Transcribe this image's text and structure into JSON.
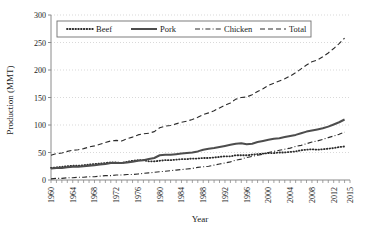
{
  "chart_data": {
    "type": "line",
    "title": "",
    "xlabel": "Year",
    "ylabel": "Production (MMT)",
    "xlim": [
      1960,
      2015
    ],
    "ylim": [
      0,
      300
    ],
    "yticks": [
      0,
      50,
      100,
      150,
      200,
      250,
      300
    ],
    "xticks": [
      1960,
      1964,
      1968,
      1972,
      1976,
      1980,
      1984,
      1988,
      1992,
      1996,
      2000,
      2004,
      2008,
      2012,
      2015
    ],
    "grid": true,
    "legend_position": "top-left",
    "x": [
      1960,
      1961,
      1962,
      1963,
      1964,
      1965,
      1966,
      1967,
      1968,
      1969,
      1970,
      1971,
      1972,
      1973,
      1974,
      1975,
      1976,
      1977,
      1978,
      1979,
      1980,
      1981,
      1982,
      1983,
      1984,
      1985,
      1986,
      1987,
      1988,
      1989,
      1990,
      1991,
      1992,
      1993,
      1994,
      1995,
      1996,
      1997,
      1998,
      1999,
      2000,
      2001,
      2002,
      2003,
      2004,
      2005,
      2006,
      2007,
      2008,
      2009,
      2010,
      2011,
      2012,
      2013,
      2014
    ],
    "series": [
      {
        "name": "Beef",
        "style": "dotted",
        "color": "#2b2b2b",
        "values": [
          22,
          23,
          24,
          25,
          26,
          26,
          27,
          28,
          29,
          30,
          31,
          32,
          32,
          31,
          33,
          35,
          36,
          36,
          34,
          34,
          35,
          36,
          36,
          37,
          38,
          38,
          39,
          39,
          40,
          40,
          41,
          42,
          43,
          43,
          45,
          45,
          45,
          46,
          47,
          48,
          49,
          49,
          50,
          50,
          51,
          52,
          54,
          55,
          56,
          55,
          56,
          57,
          58,
          60,
          61
        ]
      },
      {
        "name": "Pork",
        "style": "solid",
        "color": "#4d4d4d",
        "values": [
          21,
          22,
          22,
          23,
          24,
          24,
          25,
          26,
          27,
          28,
          29,
          31,
          31,
          31,
          32,
          33,
          35,
          36,
          38,
          40,
          45,
          46,
          46,
          47,
          48,
          49,
          50,
          52,
          55,
          57,
          58,
          60,
          62,
          64,
          66,
          67,
          65,
          66,
          69,
          71,
          73,
          75,
          76,
          78,
          80,
          82,
          85,
          88,
          90,
          92,
          94,
          97,
          101,
          105,
          110
        ]
      },
      {
        "name": "Chicken",
        "style": "dashdot",
        "color": "#2b2b2b",
        "values": [
          2,
          3,
          3,
          4,
          4,
          5,
          5,
          6,
          6,
          7,
          8,
          8,
          9,
          9,
          10,
          10,
          11,
          12,
          13,
          14,
          15,
          16,
          17,
          18,
          19,
          20,
          21,
          23,
          24,
          25,
          27,
          29,
          31,
          33,
          36,
          38,
          41,
          43,
          45,
          47,
          50,
          52,
          54,
          56,
          58,
          61,
          63,
          66,
          69,
          71,
          74,
          77,
          80,
          83,
          87
        ]
      },
      {
        "name": "Total",
        "style": "dashed",
        "color": "#2b2b2b",
        "values": [
          45,
          48,
          49,
          52,
          54,
          55,
          57,
          60,
          62,
          65,
          68,
          71,
          72,
          71,
          75,
          78,
          82,
          84,
          85,
          88,
          95,
          98,
          99,
          102,
          105,
          107,
          110,
          114,
          119,
          122,
          126,
          131,
          136,
          140,
          147,
          150,
          151,
          155,
          161,
          166,
          172,
          176,
          180,
          184,
          189,
          195,
          202,
          209,
          215,
          218,
          224,
          231,
          239,
          248,
          258
        ]
      }
    ]
  }
}
